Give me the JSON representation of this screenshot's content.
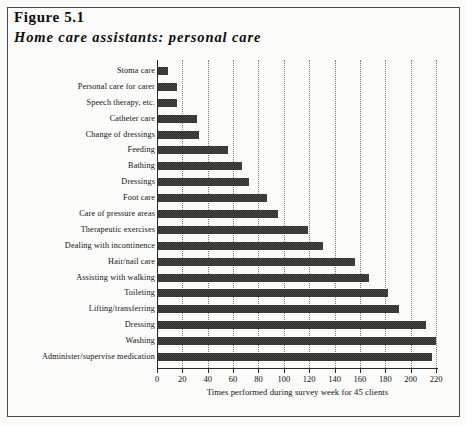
{
  "figure": {
    "title": "Figure 5.1",
    "subtitle": "Home care assistants: personal care"
  },
  "chart_data": {
    "type": "bar",
    "orientation": "horizontal",
    "title": "Home care assistants: personal care",
    "xlabel": "Times performed during survey week for 45 clients",
    "ylabel": "",
    "xlim": [
      0,
      220
    ],
    "xticks": [
      0,
      20,
      40,
      60,
      80,
      100,
      120,
      140,
      160,
      180,
      200,
      220
    ],
    "grid": "vertical-dotted",
    "legend": "none",
    "bar_color": "#3a3a3a",
    "categories": [
      "Stoma care",
      "Personal care for carer",
      "Speech therapy, etc.",
      "Catheter care",
      "Change of dressings",
      "Feeding",
      "Bathing",
      "Dressings",
      "Foot care",
      "Care of pressure areas",
      "Therapeutic exercises",
      "Dealing with incontinence",
      "Hair/nail care",
      "Assisting with walking",
      "Toileting",
      "Lifting/transferring",
      "Dressing",
      "Washing",
      "Administer/supervise medication"
    ],
    "values": [
      8,
      15,
      15,
      31,
      32,
      55,
      66,
      72,
      86,
      95,
      118,
      130,
      155,
      166,
      181,
      190,
      211,
      219,
      216
    ]
  }
}
